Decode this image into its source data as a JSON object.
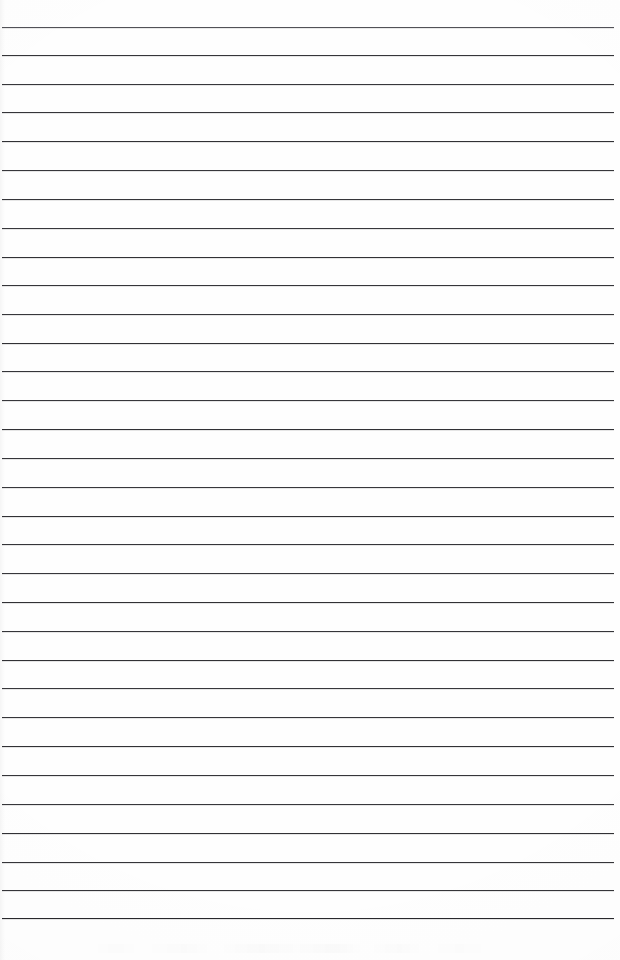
{
  "document": {
    "kind": "lined-paper-scan",
    "title": "Blank Lined Notebook Page",
    "page_width": 620,
    "page_height": 960,
    "paper_color": "#fefefe",
    "text_content": "",
    "handwriting_present": false,
    "margin_rule_present": false,
    "header_text": "",
    "footer_text": "",
    "page_number": ""
  },
  "ruling": {
    "line_color": "#2b2b2f",
    "line_count": 32,
    "first_line_y": 27,
    "line_spacing": 28.7,
    "line_thickness": 1.7,
    "line_start_x": 2,
    "line_end_x": 614,
    "left_margin": 2,
    "right_margin": 6,
    "lines": [
      {
        "index": 1,
        "y": 27,
        "x1": 2,
        "x2": 614,
        "thickness": 1.6,
        "color": "#3a3a40",
        "opacity": 0.88
      },
      {
        "index": 2,
        "y": 55,
        "x1": 2,
        "x2": 614,
        "thickness": 1.8,
        "color": "#2b2b2f",
        "opacity": 0.95
      },
      {
        "index": 3,
        "y": 84,
        "x1": 2,
        "x2": 614,
        "thickness": 1.7,
        "color": "#2b2b2f",
        "opacity": 0.94
      },
      {
        "index": 4,
        "y": 112,
        "x1": 2,
        "x2": 614,
        "thickness": 1.7,
        "color": "#2b2b2f",
        "opacity": 0.95
      },
      {
        "index": 5,
        "y": 141,
        "x1": 2,
        "x2": 614,
        "thickness": 1.8,
        "color": "#29292d",
        "opacity": 0.96
      },
      {
        "index": 6,
        "y": 170,
        "x1": 2,
        "x2": 614,
        "thickness": 1.7,
        "color": "#2b2b2f",
        "opacity": 0.94
      },
      {
        "index": 7,
        "y": 199,
        "x1": 2,
        "x2": 614,
        "thickness": 1.7,
        "color": "#2b2b2f",
        "opacity": 0.95
      },
      {
        "index": 8,
        "y": 228,
        "x1": 2,
        "x2": 614,
        "thickness": 1.7,
        "color": "#2b2b2f",
        "opacity": 0.94
      },
      {
        "index": 9,
        "y": 257,
        "x1": 2,
        "x2": 614,
        "thickness": 1.8,
        "color": "#29292d",
        "opacity": 0.96
      },
      {
        "index": 10,
        "y": 285,
        "x1": 2,
        "x2": 614,
        "thickness": 1.7,
        "color": "#2b2b2f",
        "opacity": 0.95
      },
      {
        "index": 11,
        "y": 314,
        "x1": 2,
        "x2": 614,
        "thickness": 1.7,
        "color": "#2b2b2f",
        "opacity": 0.94
      },
      {
        "index": 12,
        "y": 343,
        "x1": 2,
        "x2": 614,
        "thickness": 1.8,
        "color": "#29292d",
        "opacity": 0.96
      },
      {
        "index": 13,
        "y": 371,
        "x1": 2,
        "x2": 614,
        "thickness": 1.7,
        "color": "#2b2b2f",
        "opacity": 0.95
      },
      {
        "index": 14,
        "y": 400,
        "x1": 2,
        "x2": 614,
        "thickness": 1.7,
        "color": "#2b2b2f",
        "opacity": 0.94
      },
      {
        "index": 15,
        "y": 429,
        "x1": 2,
        "x2": 614,
        "thickness": 1.8,
        "color": "#29292d",
        "opacity": 0.96
      },
      {
        "index": 16,
        "y": 458,
        "x1": 2,
        "x2": 614,
        "thickness": 1.7,
        "color": "#2b2b2f",
        "opacity": 0.95
      },
      {
        "index": 17,
        "y": 487,
        "x1": 2,
        "x2": 614,
        "thickness": 1.7,
        "color": "#2b2b2f",
        "opacity": 0.94
      },
      {
        "index": 18,
        "y": 516,
        "x1": 2,
        "x2": 614,
        "thickness": 1.8,
        "color": "#29292d",
        "opacity": 0.96
      },
      {
        "index": 19,
        "y": 544,
        "x1": 2,
        "x2": 614,
        "thickness": 1.7,
        "color": "#2b2b2f",
        "opacity": 0.95
      },
      {
        "index": 20,
        "y": 573,
        "x1": 2,
        "x2": 614,
        "thickness": 1.7,
        "color": "#2b2b2f",
        "opacity": 0.94
      },
      {
        "index": 21,
        "y": 602,
        "x1": 2,
        "x2": 614,
        "thickness": 1.8,
        "color": "#29292d",
        "opacity": 0.96
      },
      {
        "index": 22,
        "y": 631,
        "x1": 2,
        "x2": 614,
        "thickness": 1.7,
        "color": "#2b2b2f",
        "opacity": 0.95
      },
      {
        "index": 23,
        "y": 660,
        "x1": 2,
        "x2": 614,
        "thickness": 1.8,
        "color": "#29292d",
        "opacity": 0.96
      },
      {
        "index": 24,
        "y": 688,
        "x1": 2,
        "x2": 614,
        "thickness": 1.7,
        "color": "#2b2b2f",
        "opacity": 0.94
      },
      {
        "index": 25,
        "y": 717,
        "x1": 2,
        "x2": 614,
        "thickness": 1.7,
        "color": "#2b2b2f",
        "opacity": 0.95
      },
      {
        "index": 26,
        "y": 746,
        "x1": 2,
        "x2": 614,
        "thickness": 1.8,
        "color": "#29292d",
        "opacity": 0.96
      },
      {
        "index": 27,
        "y": 775,
        "x1": 2,
        "x2": 614,
        "thickness": 1.7,
        "color": "#2b2b2f",
        "opacity": 0.95
      },
      {
        "index": 28,
        "y": 804,
        "x1": 2,
        "x2": 614,
        "thickness": 1.7,
        "color": "#2b2b2f",
        "opacity": 0.94
      },
      {
        "index": 29,
        "y": 833,
        "x1": 2,
        "x2": 614,
        "thickness": 1.8,
        "color": "#29292d",
        "opacity": 0.96
      },
      {
        "index": 30,
        "y": 862,
        "x1": 2,
        "x2": 614,
        "thickness": 1.7,
        "color": "#2b2b2f",
        "opacity": 0.95
      },
      {
        "index": 31,
        "y": 890,
        "x1": 2,
        "x2": 614,
        "thickness": 1.7,
        "color": "#2b2b2f",
        "opacity": 0.95
      },
      {
        "index": 32,
        "y": 918,
        "x1": 2,
        "x2": 614,
        "thickness": 1.8,
        "color": "#222226",
        "opacity": 0.97
      }
    ]
  },
  "artifacts": {
    "bottom_smudge_visible": true,
    "left_edge_shading_visible": true
  }
}
